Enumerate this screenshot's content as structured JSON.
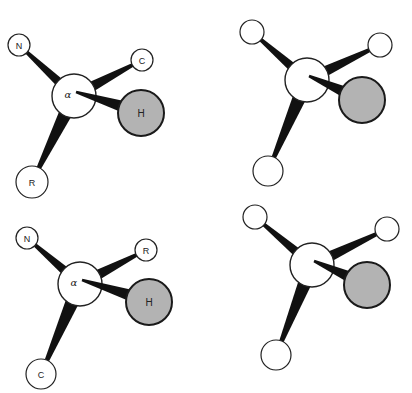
{
  "figure": {
    "colors": {
      "bond": "#111111",
      "atom_fill": "#ffffff",
      "atom_stroke": "#222222",
      "hydrogen_fill": "#b3b3b3",
      "hydrogen_stroke": "#1a1a1a"
    },
    "molecules": [
      {
        "id": "top-left",
        "center": {
          "x": 74,
          "y": 96,
          "r": 22,
          "label": "α"
        },
        "substituents": [
          {
            "name": "N",
            "label": "N",
            "x": 19,
            "y": 45,
            "r": 11,
            "w": 7
          },
          {
            "name": "C",
            "label": "C",
            "x": 142,
            "y": 60,
            "r": 11,
            "w": 8
          },
          {
            "name": "R",
            "label": "R",
            "x": 32,
            "y": 182,
            "r": 16,
            "w": 10
          }
        ],
        "hydrogen": {
          "label": "H",
          "x": 141,
          "y": 113,
          "r": 23
        }
      },
      {
        "id": "top-right",
        "center": {
          "x": 307,
          "y": 80,
          "r": 22,
          "label": ""
        },
        "substituents": [
          {
            "name": "upper-left",
            "label": "",
            "x": 252,
            "y": 32,
            "r": 12,
            "w": 7
          },
          {
            "name": "upper-right",
            "label": "",
            "x": 380,
            "y": 45,
            "r": 12,
            "w": 8
          },
          {
            "name": "bottom",
            "label": "",
            "x": 268,
            "y": 171,
            "r": 15,
            "w": 10
          }
        ],
        "hydrogen": {
          "label": "",
          "x": 362,
          "y": 100,
          "r": 23
        }
      },
      {
        "id": "bottom-left",
        "center": {
          "x": 80,
          "y": 284,
          "r": 22,
          "label": "α"
        },
        "substituents": [
          {
            "name": "N",
            "label": "N",
            "x": 27,
            "y": 238,
            "r": 11,
            "w": 7
          },
          {
            "name": "R",
            "label": "R",
            "x": 146,
            "y": 250,
            "r": 11,
            "w": 8
          },
          {
            "name": "C",
            "label": "C",
            "x": 41,
            "y": 374,
            "r": 15,
            "w": 10
          }
        ],
        "hydrogen": {
          "label": "H",
          "x": 149,
          "y": 302,
          "r": 23
        }
      },
      {
        "id": "bottom-right",
        "center": {
          "x": 312,
          "y": 265,
          "r": 22,
          "label": ""
        },
        "substituents": [
          {
            "name": "upper-left",
            "label": "",
            "x": 255,
            "y": 217,
            "r": 12,
            "w": 7
          },
          {
            "name": "upper-right",
            "label": "",
            "x": 387,
            "y": 229,
            "r": 12,
            "w": 8
          },
          {
            "name": "bottom",
            "label": "",
            "x": 276,
            "y": 355,
            "r": 15,
            "w": 10
          }
        ],
        "hydrogen": {
          "label": "",
          "x": 367,
          "y": 285,
          "r": 23
        }
      }
    ]
  }
}
